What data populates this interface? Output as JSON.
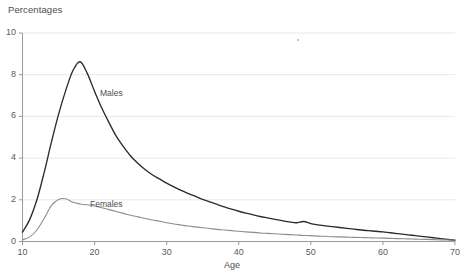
{
  "chart_data": {
    "type": "line",
    "title": "Percentages",
    "xlabel": "Age",
    "ylabel": "",
    "xlim": [
      10,
      70
    ],
    "ylim": [
      0,
      10
    ],
    "xticks": [
      10,
      20,
      30,
      40,
      50,
      60,
      70
    ],
    "yticks": [
      0,
      2,
      4,
      6,
      8,
      10
    ],
    "grid": "horizontal",
    "legend": "inline-annotations",
    "x": [
      10,
      11,
      12,
      13,
      14,
      15,
      16,
      17,
      18,
      19,
      20,
      21,
      22,
      23,
      24,
      25,
      26,
      27,
      28,
      29,
      30,
      31,
      32,
      33,
      34,
      35,
      36,
      37,
      38,
      39,
      40,
      41,
      42,
      43,
      44,
      45,
      46,
      47,
      48,
      49,
      50,
      51,
      52,
      53,
      54,
      55,
      56,
      57,
      58,
      59,
      60,
      61,
      62,
      63,
      64,
      65,
      66,
      67,
      68,
      69,
      70
    ],
    "series": [
      {
        "name": "Males",
        "color": "#2b2b2b",
        "values": [
          0.45,
          1.05,
          2.0,
          3.3,
          4.75,
          6.1,
          7.25,
          8.2,
          8.62,
          8.05,
          7.2,
          6.4,
          5.7,
          5.05,
          4.55,
          4.1,
          3.75,
          3.45,
          3.2,
          3.0,
          2.8,
          2.62,
          2.45,
          2.3,
          2.16,
          2.02,
          1.9,
          1.78,
          1.66,
          1.55,
          1.45,
          1.36,
          1.28,
          1.2,
          1.13,
          1.06,
          1.0,
          0.94,
          0.9,
          0.96,
          0.86,
          0.8,
          0.75,
          0.71,
          0.67,
          0.63,
          0.59,
          0.55,
          0.52,
          0.49,
          0.46,
          0.42,
          0.38,
          0.34,
          0.3,
          0.26,
          0.22,
          0.18,
          0.14,
          0.1,
          0.06
        ]
      },
      {
        "name": "Females",
        "color": "#8c8c8c",
        "values": [
          0.08,
          0.22,
          0.55,
          1.1,
          1.72,
          2.02,
          2.05,
          1.88,
          1.8,
          1.76,
          1.7,
          1.62,
          1.53,
          1.44,
          1.35,
          1.26,
          1.18,
          1.1,
          1.03,
          0.97,
          0.9,
          0.84,
          0.79,
          0.74,
          0.7,
          0.66,
          0.62,
          0.58,
          0.55,
          0.52,
          0.49,
          0.46,
          0.44,
          0.41,
          0.39,
          0.37,
          0.35,
          0.33,
          0.31,
          0.29,
          0.28,
          0.26,
          0.25,
          0.23,
          0.22,
          0.21,
          0.2,
          0.19,
          0.18,
          0.17,
          0.16,
          0.15,
          0.14,
          0.13,
          0.12,
          0.11,
          0.1,
          0.09,
          0.08,
          0.07,
          0.06
        ]
      }
    ],
    "annotations": [
      {
        "text": "Males",
        "x": 23,
        "y": 6.0
      },
      {
        "text": "Females",
        "x": 21,
        "y": 2.6
      }
    ]
  },
  "axis": {
    "ytick_labels": [
      "10",
      "8",
      "6",
      "4",
      "2",
      "0"
    ],
    "xtick_labels": [
      "10",
      "20",
      "30",
      "40",
      "50",
      "60",
      "70"
    ]
  },
  "colors": {
    "males_line": "#2b2b2b",
    "females_line": "#8c8c8c",
    "gridline": "#e8e8e8",
    "axis": "#9a9a9a",
    "text": "#4d4d4d",
    "background": "#ffffff"
  }
}
